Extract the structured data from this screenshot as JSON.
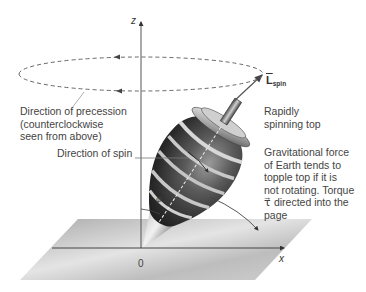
{
  "figure": {
    "axes": {
      "z_label": "z",
      "x_label": "x",
      "origin_label": "0"
    },
    "labels": {
      "precession": [
        "Direction of precession",
        "(counterclockwise",
        "seen from above)"
      ],
      "spin": "Direction of spin",
      "angle": "φ",
      "L_main": "L",
      "L_sub": "spin",
      "top": [
        "Rapidly",
        "spinning top"
      ],
      "gravity": [
        "Gravitational force",
        "of Earth tends to",
        "topple top if it is",
        "not rotating. Torque",
        "τ⃗ directed into the",
        "page"
      ]
    },
    "colors": {
      "line": "#555555",
      "plane": "#c8c8c8",
      "top_dark": "#2a2a2a",
      "top_stripe": "#d0d0d0"
    }
  }
}
